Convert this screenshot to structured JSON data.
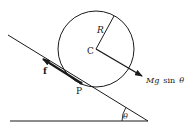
{
  "diagram": {
    "labels": {
      "radius": "R",
      "center": "C",
      "contact_point": "P",
      "friction": "f",
      "force_mg": "Mg",
      "force_sin": "sin",
      "force_theta": "θ",
      "angle": "θ"
    },
    "colors": {
      "line": "#1a1a1a",
      "background": "#ffffff"
    }
  }
}
